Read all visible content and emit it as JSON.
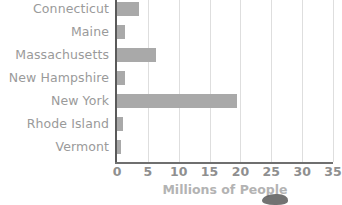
{
  "chart_data": {
    "type": "bar",
    "orientation": "horizontal",
    "title": "",
    "xlabel": "Millions of People",
    "ylabel": "",
    "categories": [
      "Connecticut",
      "Maine",
      "Massachusetts",
      "New Hampshire",
      "New York",
      "Rhode Island",
      "Vermont"
    ],
    "values": [
      3.6,
      1.3,
      6.4,
      1.3,
      19.4,
      1.0,
      0.6
    ],
    "xlim": [
      0,
      35
    ],
    "xticks": [
      "0",
      "5",
      "10",
      "15",
      "20",
      "25",
      "30",
      "35"
    ],
    "xtick_values": [
      0,
      5,
      10,
      15,
      20,
      25,
      30,
      35
    ],
    "grid": true,
    "legend": false,
    "bar_color": "#a9a9a9",
    "gridline_color": "#dedede",
    "axis_color": "#5a5a5a",
    "label_color": "#9a9a9a",
    "tick_color": "#8f8f8f",
    "xlabel_color": "#b3b3b3"
  }
}
